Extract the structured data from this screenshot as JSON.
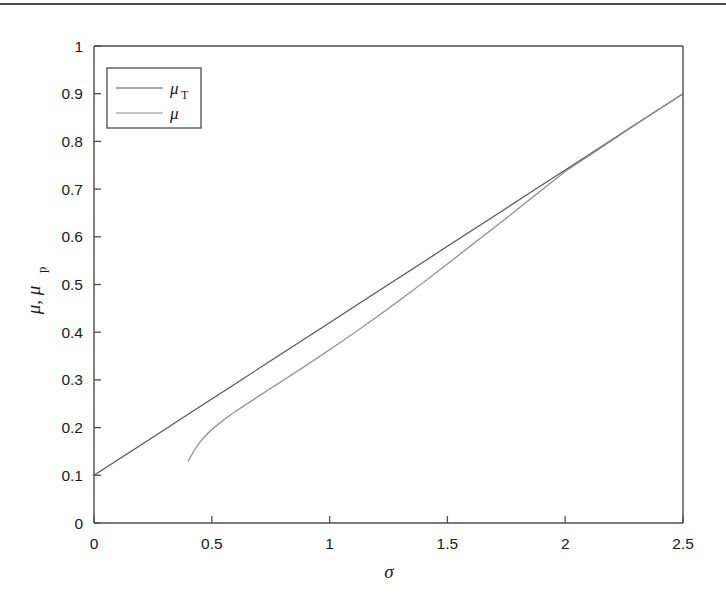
{
  "figure": {
    "background_color": "#ffffff",
    "top_rule_color": "#4a4a4a",
    "axis_color": "#4d4d4d"
  },
  "axes": {
    "x_label": "σ",
    "y_label_main": "μ, μ",
    "y_label_sub": "p",
    "x_ticks": [
      "0",
      "0.5",
      "1",
      "1.5",
      "2",
      "2.5"
    ],
    "y_ticks": [
      "0",
      "0.1",
      "0.2",
      "0.3",
      "0.4",
      "0.5",
      "0.6",
      "0.7",
      "0.8",
      "0.9",
      "1"
    ]
  },
  "legend": {
    "entries": [
      {
        "label_main": "μ",
        "label_sub": "T",
        "color": "#555555"
      },
      {
        "label_main": "μ",
        "label_sub": "",
        "color": "#8a8a8a"
      }
    ]
  },
  "chart_data": {
    "type": "line",
    "title": "",
    "xlabel": "σ",
    "ylabel": "μ, μ_p",
    "xlim": [
      0,
      2.5
    ],
    "ylim": [
      0,
      1
    ],
    "xticks": [
      0,
      0.5,
      1,
      1.5,
      2,
      2.5
    ],
    "yticks": [
      0,
      0.1,
      0.2,
      0.3,
      0.4,
      0.5,
      0.6,
      0.7,
      0.8,
      0.9,
      1
    ],
    "grid": false,
    "legend_position": "upper left",
    "series": [
      {
        "name": "μ_T",
        "color": "#555555",
        "x": [
          0.0,
          0.125,
          0.25,
          0.375,
          0.5,
          0.625,
          0.75,
          0.875,
          1.0,
          1.125,
          1.25,
          1.375,
          1.5,
          1.625,
          1.75,
          1.875,
          2.0,
          2.125,
          2.25,
          2.375,
          2.5
        ],
        "y": [
          0.1,
          0.14,
          0.18,
          0.22,
          0.26,
          0.3,
          0.34,
          0.38,
          0.42,
          0.46,
          0.5,
          0.54,
          0.58,
          0.62,
          0.66,
          0.7,
          0.74,
          0.78,
          0.82,
          0.86,
          0.9
        ]
      },
      {
        "name": "μ",
        "color": "#8a8a8a",
        "x": [
          0.4,
          0.425,
          0.45,
          0.475,
          0.5,
          0.55,
          0.6,
          0.65,
          0.7,
          0.8,
          0.9,
          1.0,
          1.1,
          1.2,
          1.3,
          1.4,
          1.5,
          1.625,
          1.75,
          1.875,
          2.0,
          2.125,
          2.25,
          2.375,
          2.5
        ],
        "y": [
          0.13,
          0.152,
          0.17,
          0.184,
          0.196,
          0.216,
          0.234,
          0.25,
          0.266,
          0.298,
          0.33,
          0.363,
          0.397,
          0.432,
          0.468,
          0.505,
          0.543,
          0.591,
          0.639,
          0.688,
          0.737,
          0.778,
          0.819,
          0.86,
          0.9
        ]
      }
    ],
    "annotations": []
  }
}
